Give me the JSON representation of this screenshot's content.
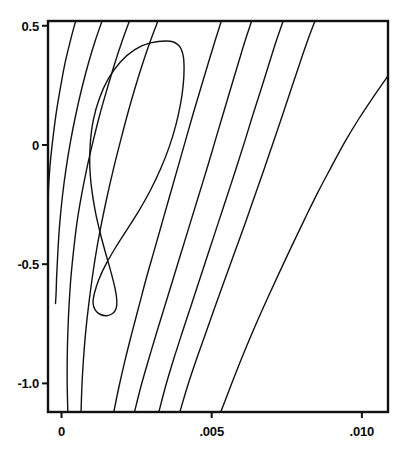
{
  "chart_data": {
    "type": "line",
    "subtype": "contour",
    "title": "",
    "subtitle": "",
    "xlabel": "",
    "ylabel": "",
    "xlim": [
      -0.00045,
      0.01087
    ],
    "ylim": [
      -1.12,
      0.52
    ],
    "grid": false,
    "legend": "none",
    "background": "#ffffff",
    "line_color": "#111111",
    "frame_color": "#111111",
    "x_ticks": [
      {
        "label": "0",
        "value": 0
      },
      {
        "label": ".005",
        "value": 0.005
      },
      {
        "label": ".010",
        "value": 0.01
      }
    ],
    "y_ticks": [
      {
        "label": "0.5",
        "value": 0.5
      },
      {
        "label": "0",
        "value": 0
      },
      {
        "label": "-0.5",
        "value": -0.5
      },
      {
        "label": "-1.0",
        "value": -1.0
      }
    ],
    "contours": [
      {
        "name": "closed-loop-innermost",
        "closed": true,
        "points": [
          [
            0.00362,
            0.435
          ],
          [
            0.00392,
            0.415
          ],
          [
            0.00405,
            0.375
          ],
          [
            0.00408,
            0.32
          ],
          [
            0.00405,
            0.25
          ],
          [
            0.00396,
            0.17
          ],
          [
            0.0038,
            0.08
          ],
          [
            0.00358,
            -0.01
          ],
          [
            0.0033,
            -0.1
          ],
          [
            0.00296,
            -0.19
          ],
          [
            0.00258,
            -0.275
          ],
          [
            0.00218,
            -0.355
          ],
          [
            0.0018,
            -0.43
          ],
          [
            0.00148,
            -0.5
          ],
          [
            0.00124,
            -0.565
          ],
          [
            0.0011,
            -0.62
          ],
          [
            0.00105,
            -0.662
          ],
          [
            0.00112,
            -0.692
          ],
          [
            0.00128,
            -0.71
          ],
          [
            0.0015,
            -0.716
          ],
          [
            0.0017,
            -0.707
          ],
          [
            0.00182,
            -0.685
          ],
          [
            0.00184,
            -0.65
          ],
          [
            0.00178,
            -0.6
          ],
          [
            0.00164,
            -0.53
          ],
          [
            0.00146,
            -0.45
          ],
          [
            0.00128,
            -0.365
          ],
          [
            0.00112,
            -0.275
          ],
          [
            0.001,
            -0.18
          ],
          [
            0.00094,
            -0.085
          ],
          [
            0.00096,
            0.01
          ],
          [
            0.00106,
            0.105
          ],
          [
            0.00126,
            0.195
          ],
          [
            0.00156,
            0.278
          ],
          [
            0.00196,
            0.348
          ],
          [
            0.00244,
            0.4
          ],
          [
            0.00296,
            0.428
          ],
          [
            0.00362,
            0.435
          ]
        ]
      },
      {
        "name": "open-curve-1-leftmost",
        "closed": false,
        "points": [
          [
            0.00047,
            0.52
          ],
          [
            0.0003,
            0.44
          ],
          [
            0.00012,
            0.345
          ],
          [
            -3e-05,
            0.245
          ],
          [
            -0.00017,
            0.14
          ],
          [
            -0.00028,
            0.035
          ],
          [
            -0.00037,
            -0.07
          ],
          [
            -0.00043,
            -0.175
          ],
          [
            -0.00045,
            -0.28
          ],
          [
            -0.00045,
            -0.38
          ],
          [
            -0.00045,
            -0.46
          ]
        ]
      },
      {
        "name": "open-curve-2",
        "closed": false,
        "points": [
          [
            0.00135,
            0.52
          ],
          [
            0.00113,
            0.44
          ],
          [
            0.0009,
            0.345
          ],
          [
            0.00068,
            0.24
          ],
          [
            0.00048,
            0.13
          ],
          [
            0.0003,
            0.015
          ],
          [
            0.00015,
            -0.1
          ],
          [
            3e-05,
            -0.215
          ],
          [
            -6e-05,
            -0.33
          ],
          [
            -0.00012,
            -0.445
          ],
          [
            -0.00016,
            -0.545
          ],
          [
            -0.00018,
            -0.62
          ],
          [
            -0.0002,
            -0.665
          ]
        ]
      },
      {
        "name": "open-curve-3",
        "closed": false,
        "points": [
          [
            0.00226,
            0.52
          ],
          [
            0.00203,
            0.44
          ],
          [
            0.00178,
            0.345
          ],
          [
            0.00153,
            0.24
          ],
          [
            0.00128,
            0.13
          ],
          [
            0.00105,
            0.015
          ],
          [
            0.00084,
            -0.1
          ],
          [
            0.00066,
            -0.215
          ],
          [
            0.00051,
            -0.33
          ],
          [
            0.0004,
            -0.445
          ],
          [
            0.00031,
            -0.56
          ],
          [
            0.00025,
            -0.675
          ],
          [
            0.00021,
            -0.79
          ],
          [
            0.00019,
            -0.9
          ],
          [
            0.00019,
            -1.01
          ],
          [
            0.00021,
            -1.12
          ]
        ]
      },
      {
        "name": "open-curve-4",
        "closed": false,
        "points": [
          [
            0.00321,
            0.52
          ],
          [
            0.00297,
            0.44
          ],
          [
            0.00271,
            0.345
          ],
          [
            0.00245,
            0.24
          ],
          [
            0.0022,
            0.13
          ],
          [
            0.00196,
            0.015
          ],
          [
            0.00173,
            -0.1
          ],
          [
            0.00152,
            -0.215
          ],
          [
            0.00133,
            -0.33
          ],
          [
            0.00116,
            -0.445
          ],
          [
            0.00102,
            -0.56
          ],
          [
            0.0009,
            -0.675
          ],
          [
            0.0008,
            -0.79
          ],
          [
            0.00073,
            -0.9
          ],
          [
            0.00068,
            -1.01
          ],
          [
            0.00065,
            -1.12
          ]
        ]
      },
      {
        "name": "open-curve-5",
        "closed": false,
        "points": [
          [
            0.00532,
            0.52
          ],
          [
            0.00512,
            0.44
          ],
          [
            0.00489,
            0.345
          ],
          [
            0.00464,
            0.24
          ],
          [
            0.00438,
            0.13
          ],
          [
            0.00412,
            0.015
          ],
          [
            0.00386,
            -0.1
          ],
          [
            0.0036,
            -0.215
          ],
          [
            0.00334,
            -0.33
          ],
          [
            0.00308,
            -0.445
          ],
          [
            0.00282,
            -0.56
          ],
          [
            0.00258,
            -0.675
          ],
          [
            0.00234,
            -0.79
          ],
          [
            0.00212,
            -0.9
          ],
          [
            0.00192,
            -1.01
          ],
          [
            0.00174,
            -1.12
          ]
        ]
      },
      {
        "name": "open-curve-6",
        "closed": false,
        "points": [
          [
            0.00633,
            0.52
          ],
          [
            0.00612,
            0.44
          ],
          [
            0.00589,
            0.345
          ],
          [
            0.00564,
            0.24
          ],
          [
            0.00538,
            0.13
          ],
          [
            0.00511,
            0.015
          ],
          [
            0.00484,
            -0.1
          ],
          [
            0.00456,
            -0.215
          ],
          [
            0.00428,
            -0.33
          ],
          [
            0.004,
            -0.445
          ],
          [
            0.00372,
            -0.56
          ],
          [
            0.00344,
            -0.675
          ],
          [
            0.00316,
            -0.79
          ],
          [
            0.0029,
            -0.9
          ],
          [
            0.00265,
            -1.01
          ],
          [
            0.00243,
            -1.12
          ]
        ]
      },
      {
        "name": "open-curve-7",
        "closed": false,
        "points": [
          [
            0.00738,
            0.52
          ],
          [
            0.00716,
            0.44
          ],
          [
            0.00692,
            0.345
          ],
          [
            0.00666,
            0.24
          ],
          [
            0.00638,
            0.13
          ],
          [
            0.0061,
            0.015
          ],
          [
            0.00581,
            -0.1
          ],
          [
            0.00551,
            -0.215
          ],
          [
            0.00521,
            -0.33
          ],
          [
            0.00491,
            -0.445
          ],
          [
            0.00461,
            -0.56
          ],
          [
            0.00431,
            -0.675
          ],
          [
            0.00401,
            -0.79
          ],
          [
            0.00373,
            -0.9
          ],
          [
            0.00347,
            -1.01
          ],
          [
            0.00324,
            -1.12
          ]
        ]
      },
      {
        "name": "open-curve-8",
        "closed": false,
        "points": [
          [
            0.00844,
            0.52
          ],
          [
            0.0082,
            0.44
          ],
          [
            0.00794,
            0.345
          ],
          [
            0.00766,
            0.24
          ],
          [
            0.00737,
            0.13
          ],
          [
            0.00706,
            0.015
          ],
          [
            0.00675,
            -0.1
          ],
          [
            0.00643,
            -0.215
          ],
          [
            0.00611,
            -0.33
          ],
          [
            0.00578,
            -0.445
          ],
          [
            0.00545,
            -0.56
          ],
          [
            0.00512,
            -0.675
          ],
          [
            0.0048,
            -0.79
          ],
          [
            0.00449,
            -0.9
          ],
          [
            0.0042,
            -1.01
          ],
          [
            0.00394,
            -1.12
          ]
        ]
      },
      {
        "name": "open-curve-9-rightmost",
        "closed": false,
        "points": [
          [
            0.01087,
            0.29
          ],
          [
            0.0104,
            0.205
          ],
          [
            0.0099,
            0.11
          ],
          [
            0.00942,
            0.01
          ],
          [
            0.00897,
            -0.095
          ],
          [
            0.00853,
            -0.2
          ],
          [
            0.0081,
            -0.31
          ],
          [
            0.00768,
            -0.42
          ],
          [
            0.00727,
            -0.53
          ],
          [
            0.00687,
            -0.64
          ],
          [
            0.00648,
            -0.75
          ],
          [
            0.00611,
            -0.86
          ],
          [
            0.00576,
            -0.97
          ],
          [
            0.00544,
            -1.075
          ],
          [
            0.0053,
            -1.12
          ]
        ]
      }
    ]
  },
  "geometry": {
    "plot_left": 48,
    "plot_right": 388,
    "plot_top": 21,
    "plot_bottom": 412,
    "tick_length": 6
  }
}
